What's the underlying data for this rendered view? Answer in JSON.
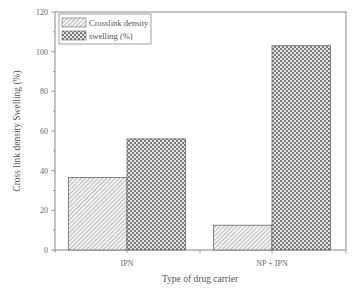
{
  "chart_data": {
    "type": "bar",
    "title": "",
    "xlabel": "Type of drug carrier",
    "ylabel": "Cross link density Swelling (%)",
    "categories": [
      "IPN",
      "NP + IPN"
    ],
    "series": [
      {
        "name": "Crosslink density",
        "pattern": "diagonal-hatch",
        "values": [
          36.5,
          12.5
        ]
      },
      {
        "name": "swelling (%)",
        "pattern": "crosshatch-checker",
        "values": [
          56,
          103
        ]
      }
    ],
    "ylim": [
      0,
      120
    ],
    "yticks": [
      0,
      20,
      40,
      60,
      80,
      100,
      120
    ],
    "grid": false,
    "legend_position": "upper-left"
  },
  "axis": {
    "xlabel": "Type of drug carrier",
    "ylabel": "Cross link density Swelling (%)",
    "yticks": [
      "0",
      "20",
      "40",
      "60",
      "80",
      "100",
      "120"
    ],
    "categories": [
      "IPN",
      "NP + IPN"
    ]
  },
  "legend": {
    "items": [
      {
        "label": "Crosslink density"
      },
      {
        "label": "swelling (%)"
      }
    ]
  },
  "colors": {
    "axis": "#777777",
    "bar_edge": "#666666",
    "hatch": "#8a8a8a",
    "checker": "#7a7a7a"
  }
}
